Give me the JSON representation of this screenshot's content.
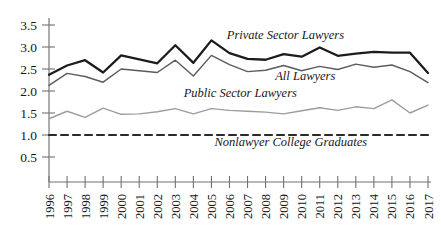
{
  "chart_data": {
    "type": "line",
    "title": "",
    "subtitle": "",
    "xlabel": "",
    "ylabel": "",
    "grid": false,
    "legend_position": "inline-annotations",
    "x": [
      1996,
      1997,
      1998,
      1999,
      2000,
      2001,
      2002,
      2003,
      2004,
      2005,
      2006,
      2007,
      2008,
      2009,
      2010,
      2011,
      2012,
      2013,
      2014,
      2015,
      2016,
      2017
    ],
    "xtick_labels": [
      "1996",
      "1997",
      "1998",
      "1999",
      "2000",
      "2001",
      "2002",
      "2003",
      "2004",
      "2005",
      "2006",
      "2007",
      "2008",
      "2009",
      "2010",
      "2011",
      "2012",
      "2013",
      "2014",
      "2015",
      "2016",
      "2017"
    ],
    "ytick_labels": [
      "3.5",
      "3.0",
      "2.5",
      "2.0",
      "1.5",
      "1.0",
      "0.5"
    ],
    "ytick_values": [
      3.5,
      3.0,
      2.5,
      2.0,
      1.5,
      1.0,
      0.5
    ],
    "ylim": [
      0.3,
      3.75
    ],
    "xlim": [
      1996,
      2017
    ],
    "series": [
      {
        "name": "Private Sector Lawyers",
        "color": "#1c1c1f",
        "width": 2.3,
        "style": "solid",
        "label_x": 2009.1,
        "label_y": 3.18,
        "values": [
          2.37,
          2.58,
          2.7,
          2.42,
          2.81,
          2.72,
          2.63,
          3.04,
          2.64,
          3.15,
          2.86,
          2.73,
          2.71,
          2.84,
          2.78,
          2.99,
          2.8,
          2.85,
          2.89,
          2.87,
          2.87,
          2.41
        ]
      },
      {
        "name": "All Lawyers",
        "color": "#5a5c60",
        "width": 1.45,
        "style": "solid",
        "label_x": 2010.2,
        "label_y": 2.24,
        "values": [
          2.13,
          2.4,
          2.33,
          2.2,
          2.5,
          2.46,
          2.42,
          2.7,
          2.34,
          2.81,
          2.6,
          2.44,
          2.47,
          2.58,
          2.46,
          2.56,
          2.49,
          2.61,
          2.54,
          2.59,
          2.44,
          2.19
        ]
      },
      {
        "name": "Public Sector Lawyers",
        "color": "#9a9da1",
        "width": 1.45,
        "style": "solid",
        "label_x": 2006.6,
        "label_y": 1.86,
        "values": [
          1.37,
          1.54,
          1.4,
          1.61,
          1.47,
          1.48,
          1.53,
          1.6,
          1.48,
          1.6,
          1.56,
          1.54,
          1.52,
          1.48,
          1.55,
          1.62,
          1.56,
          1.64,
          1.6,
          1.8,
          1.5,
          1.68
        ]
      },
      {
        "name": "Nonlawyer College Graduates",
        "color": "#2b2b2e",
        "width": 2.2,
        "style": "dashed",
        "label_x": 2009.4,
        "label_y": 0.74,
        "values": [
          1.0,
          1.0,
          1.0,
          1.0,
          1.0,
          1.0,
          1.0,
          1.0,
          1.0,
          1.0,
          1.0,
          1.0,
          1.0,
          1.0,
          1.0,
          1.0,
          1.0,
          1.0,
          1.0,
          1.0,
          1.0,
          1.0
        ]
      }
    ]
  },
  "axes": {
    "axis_color": "#6f7175",
    "tick_color": "#6f7175",
    "text_color": "#17171a"
  }
}
